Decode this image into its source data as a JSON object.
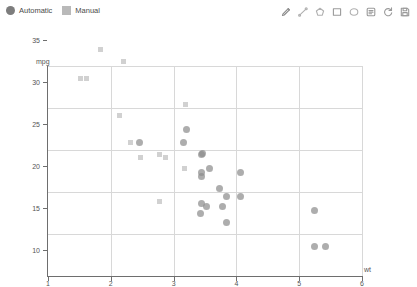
{
  "legend": {
    "position": "top-left",
    "items": [
      {
        "label": "Automatic",
        "marker": "circle",
        "color": "#7d7d7d"
      },
      {
        "label": "Manual",
        "marker": "square",
        "color": "#b9b9b9"
      }
    ]
  },
  "toolbar": {
    "items": [
      {
        "name": "pencil-icon",
        "label": "Draw"
      },
      {
        "name": "line-icon",
        "label": "Line"
      },
      {
        "name": "polygon-icon",
        "label": "Polygon"
      },
      {
        "name": "rectangle-icon",
        "label": "Rectangle"
      },
      {
        "name": "ellipse-icon",
        "label": "Ellipse"
      },
      {
        "name": "note-icon",
        "label": "Note"
      },
      {
        "name": "refresh-icon",
        "label": "Reset"
      },
      {
        "name": "save-icon",
        "label": "Save"
      }
    ]
  },
  "chart_data": {
    "type": "scatter",
    "title": "",
    "xlabel": "wt",
    "ylabel": "mpg",
    "xlim": [
      1,
      6
    ],
    "ylim": [
      10,
      35
    ],
    "xticks": [
      1,
      2,
      3,
      4,
      5,
      6
    ],
    "yticks": [
      10,
      15,
      20,
      25,
      30,
      35
    ],
    "grid": true,
    "legend_position": "top-left",
    "series": [
      {
        "name": "Automatic",
        "marker": "circle",
        "color": "#8e8e8e",
        "points": [
          [
            2.46,
            22.8
          ],
          [
            3.21,
            24.4
          ],
          [
            3.15,
            22.8
          ],
          [
            3.44,
            21.4
          ],
          [
            3.46,
            21.5
          ],
          [
            3.44,
            19.2
          ],
          [
            3.44,
            18.7
          ],
          [
            3.57,
            19.7
          ],
          [
            3.73,
            17.3
          ],
          [
            3.84,
            16.4
          ],
          [
            3.78,
            15.2
          ],
          [
            3.44,
            15.5
          ],
          [
            3.52,
            15.2
          ],
          [
            3.43,
            14.3
          ],
          [
            4.07,
            19.2
          ],
          [
            3.845,
            13.3
          ],
          [
            4.07,
            16.4
          ],
          [
            5.25,
            14.7
          ],
          [
            5.25,
            10.4
          ],
          [
            5.424,
            10.4
          ]
        ]
      },
      {
        "name": "Manual",
        "marker": "square",
        "color": "#c9c9c9",
        "points": [
          [
            1.513,
            30.4
          ],
          [
            1.615,
            30.4
          ],
          [
            1.835,
            33.9
          ],
          [
            2.2,
            32.4
          ],
          [
            2.14,
            26.0
          ],
          [
            2.32,
            22.8
          ],
          [
            2.465,
            21.0
          ],
          [
            2.78,
            21.4
          ],
          [
            2.875,
            21.0
          ],
          [
            3.17,
            19.7
          ],
          [
            2.77,
            15.8
          ],
          [
            3.19,
            27.3
          ]
        ]
      }
    ]
  }
}
